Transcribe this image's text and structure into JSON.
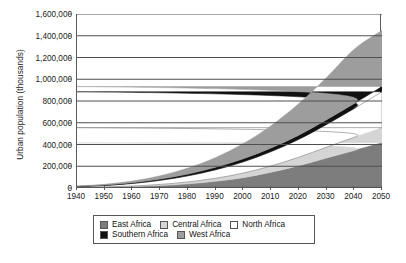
{
  "chart_data": {
    "type": "area",
    "title": "",
    "xlabel": "",
    "ylabel": "Urban population (thousands)",
    "stacked": true,
    "grid": true,
    "legend_position": "bottom",
    "xlim": [
      1940,
      2050
    ],
    "ylim": [
      0,
      1600000
    ],
    "x": [
      1940,
      1950,
      1960,
      1970,
      1980,
      1990,
      2000,
      2010,
      2020,
      2030,
      2040,
      2050
    ],
    "xticklabels": [
      "1940",
      "1950",
      "1960",
      "1970",
      "1980",
      "1990",
      "2000",
      "2010",
      "2020",
      "2030",
      "2040",
      "2050"
    ],
    "yticks": [
      0,
      200000,
      400000,
      600000,
      800000,
      1000000,
      1200000,
      1400000,
      1600000
    ],
    "yticklabels": [
      "0",
      "200,000",
      "400,000",
      "600,000",
      "800,000",
      "1,000,000",
      "1,200,000",
      "1,400,000",
      "1,600,000"
    ],
    "series": [
      {
        "name": "East Africa",
        "color": "#7d7d7d",
        "values": [
          3000,
          6000,
          12000,
          22000,
          38000,
          62000,
          95000,
          145000,
          205000,
          275000,
          345000,
          415000
        ]
      },
      {
        "name": "Central Africa",
        "color": "#d5d5d5",
        "values": [
          1500,
          3000,
          6000,
          11000,
          18000,
          28000,
          42000,
          58000,
          78000,
          100000,
          122000,
          140000
        ]
      },
      {
        "name": "North Africa",
        "color": "#ffffff",
        "values": [
          8000,
          14000,
          24000,
          38000,
          56000,
          78000,
          104000,
          132000,
          165000,
          210000,
          265000,
          330000
        ]
      },
      {
        "name": "Southern Africa",
        "color": "#111111",
        "values": [
          2500,
          4000,
          7000,
          11000,
          16000,
          22000,
          28000,
          33000,
          38000,
          42000,
          45000,
          48000
        ]
      },
      {
        "name": "West Africa",
        "color": "#9d9d9d",
        "values": [
          3000,
          7000,
          15000,
          30000,
          55000,
          90000,
          140000,
          205000,
          290000,
          390000,
          500000,
          517000
        ]
      }
    ]
  },
  "legend": {
    "rows": [
      [
        {
          "label": "East Africa",
          "color": "#7d7d7d"
        },
        {
          "label": "Central Africa",
          "color": "#d5d5d5"
        },
        {
          "label": "North Africa",
          "color": "#ffffff"
        }
      ],
      [
        {
          "label": "Southern Africa",
          "color": "#111111"
        },
        {
          "label": "West Africa",
          "color": "#9d9d9d"
        }
      ]
    ]
  }
}
